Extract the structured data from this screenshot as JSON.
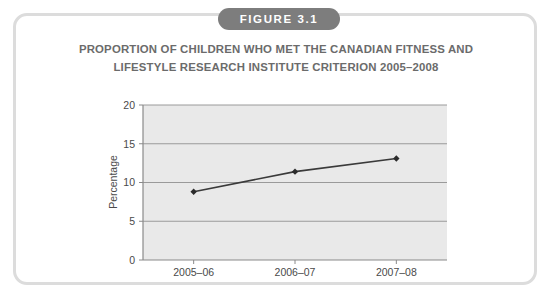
{
  "figure": {
    "badge_label": "FIGURE 3.1",
    "badge_color": "#7d7d7d",
    "badge_text_color": "#ffffff",
    "border_color": "#dcdcdc",
    "card_background": "#ffffff"
  },
  "chart_data": {
    "type": "line",
    "title": "PROPORTION OF CHILDREN WHO MET THE CANADIAN FITNESS AND LIFESTYLE RESEARCH INSTITUTE CRITERION 2005–2008",
    "title_line_1": "PROPORTION OF CHILDREN WHO MET THE CANADIAN FITNESS AND",
    "title_line_2": "LIFESTYLE RESEARCH INSTITUTE CRITERION 2005–2008",
    "title_color": "#6b6b6b",
    "categories": [
      "2005–06",
      "2006–07",
      "2007–08"
    ],
    "values": [
      8.8,
      11.4,
      13.1
    ],
    "series": [
      {
        "name": "Percentage of children meeting criterion",
        "values": [
          8.8,
          11.4,
          13.1
        ]
      }
    ],
    "xlabel": "",
    "ylabel": "Percentage",
    "ylim": [
      0,
      20
    ],
    "yticks": [
      0,
      5,
      10,
      15,
      20
    ],
    "ytick_labels": [
      "0",
      "5",
      "10",
      "15",
      "20"
    ],
    "xtick_labels": [
      "2005–06",
      "2006–07",
      "2007–08"
    ],
    "grid": true,
    "grid_axis": "y",
    "grid_color": "#9a9a9a",
    "legend": false,
    "legend_position": "none",
    "plot_background": "#e9e9e9",
    "line_color": "#3a3a3a",
    "marker": "diamond",
    "marker_color": "#2b2b2b",
    "axis_color": "#8a8a8a"
  }
}
